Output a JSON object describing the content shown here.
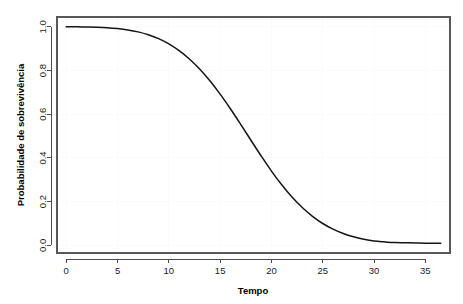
{
  "figure": {
    "background_color": "#ffffff",
    "plot_area": {
      "left": 57,
      "top": 17,
      "right": 450,
      "bottom": 253,
      "border_color": "#585858"
    }
  },
  "chart_data": {
    "type": "line",
    "title": "",
    "subtitle": "",
    "xlabel": "Tempo",
    "ylabel": "Probabilidade de sobrevivência",
    "xlim": [
      -0.9,
      37.4
    ],
    "ylim": [
      -0.035,
      1.045
    ],
    "xticks": [
      0,
      5,
      10,
      15,
      20,
      25,
      30,
      35
    ],
    "xticklabels": [
      "0",
      "5",
      "10",
      "15",
      "20",
      "25",
      "30",
      "35"
    ],
    "yticks": [
      0.0,
      0.2,
      0.4,
      0.6,
      0.8,
      1.0
    ],
    "yticklabels": [
      "0.0",
      "0.2",
      "0.4",
      "0.6",
      "0.8",
      "1.0"
    ],
    "grid": false,
    "legend": null,
    "line_color": "#141414",
    "line_width": 1.5,
    "series": [
      {
        "name": "Probabilidade de sobrevivência",
        "x": [
          0,
          1,
          2,
          3,
          4,
          5,
          6,
          7,
          8,
          9,
          10,
          11,
          12,
          13,
          14,
          15,
          16,
          17,
          18,
          19,
          20,
          21,
          22,
          23,
          24,
          25,
          26,
          27,
          28,
          29,
          30,
          31,
          32,
          33,
          34,
          35,
          36,
          36.5
        ],
        "values": [
          1.0,
          1.0,
          0.999,
          0.998,
          0.996,
          0.992,
          0.986,
          0.977,
          0.964,
          0.946,
          0.922,
          0.891,
          0.853,
          0.807,
          0.753,
          0.692,
          0.625,
          0.554,
          0.481,
          0.409,
          0.34,
          0.277,
          0.221,
          0.173,
          0.133,
          0.1,
          0.074,
          0.054,
          0.039,
          0.028,
          0.02,
          0.016,
          0.013,
          0.012,
          0.011,
          0.01,
          0.01,
          0.01
        ]
      }
    ],
    "annotations": []
  },
  "axis_labels": {
    "x_title": "Tempo",
    "y_title": "Probabilidade de sobrevivência"
  }
}
